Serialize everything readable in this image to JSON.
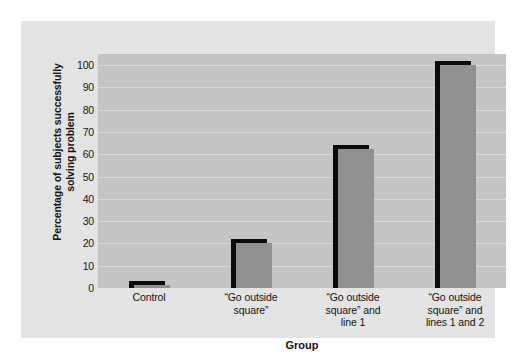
{
  "chart_data": {
    "type": "bar",
    "title": "",
    "xlabel": "Group",
    "ylabel": "Percentage of subjects successfully solving problem",
    "categories": [
      "Control",
      "“Go outside square”",
      "“Go outside square” and line 1",
      "“Go outside square” and lines 1 and 2"
    ],
    "category_lines": [
      [
        "Control"
      ],
      [
        "“Go outside",
        "square”"
      ],
      [
        "“Go outside",
        "square” and",
        "line 1"
      ],
      [
        "“Go outside",
        "square” and",
        "lines 1 and 2"
      ]
    ],
    "values": [
      3,
      22,
      64,
      102
    ],
    "ylim": [
      0,
      105
    ],
    "yticks": [
      0,
      10,
      20,
      30,
      40,
      50,
      60,
      70,
      80,
      90,
      100
    ],
    "ytick_labels": [
      "0",
      "10",
      "20",
      "30",
      "40",
      "50",
      "60",
      "70",
      "80",
      "90",
      "100"
    ],
    "grid": true,
    "legend": "none",
    "colors": {
      "bar_fill": "#919191",
      "bar_edge": "#0c0c0c",
      "plot_background": "#c4c4c4",
      "panel_background": "#e3e3e3",
      "gridline": "#d8d8d8",
      "text": "#141414"
    }
  }
}
